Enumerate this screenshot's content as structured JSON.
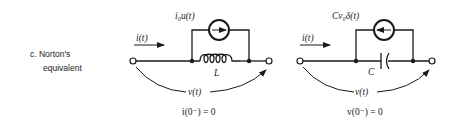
{
  "section": {
    "label_line1": "c. Norton's",
    "label_line2": "equivalent"
  },
  "inductor_circuit": {
    "current_label": "i(t)",
    "source_label": "i₀u(t)",
    "component_label": "L",
    "voltage_label": "v(t)",
    "initial_condition": "i(0⁻) = 0",
    "source_arrow_direction": "right"
  },
  "capacitor_circuit": {
    "current_label": "i(t)",
    "source_label": "Cv₀δ(t)",
    "component_label": "C",
    "voltage_label": "v(t)",
    "initial_condition": "v(0⁻) = 0",
    "source_arrow_direction": "left"
  }
}
